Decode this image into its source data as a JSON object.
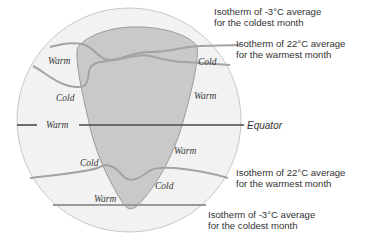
{
  "diagram": {
    "colors": {
      "globe_fill": "#f2f2f2",
      "globe_stroke": "#c8c8c8",
      "continent_fill": "#c9c9c9",
      "continent_stroke": "#9a9a9a",
      "isotherm_stroke": "#a3a3a3",
      "equator_stroke": "#4a4a4a"
    },
    "zone_labels": {
      "n_warm_left": "Warm",
      "n_cold_left": "Cold",
      "n_cold_right": "Cold",
      "n_warm_right": "Warm",
      "equator_warm": "Warm",
      "s_warm_right": "Warm",
      "s_cold_left": "Cold",
      "s_cold_right": "Cold",
      "s_warm_bottom": "Warm"
    },
    "equator_label": "Equator",
    "callouts": {
      "north_coldest": {
        "line1": "Isotherm of -3°C average",
        "line2": "for the coldest month"
      },
      "north_warmest": {
        "line1": "Isotherm of 22°C average",
        "line2": "for the warmest month"
      },
      "south_warmest": {
        "line1": "Isotherm of 22°C average",
        "line2": "for the warmest month"
      },
      "south_coldest": {
        "line1": "Isotherm of -3°C average",
        "line2": "for the coldest month"
      }
    }
  }
}
